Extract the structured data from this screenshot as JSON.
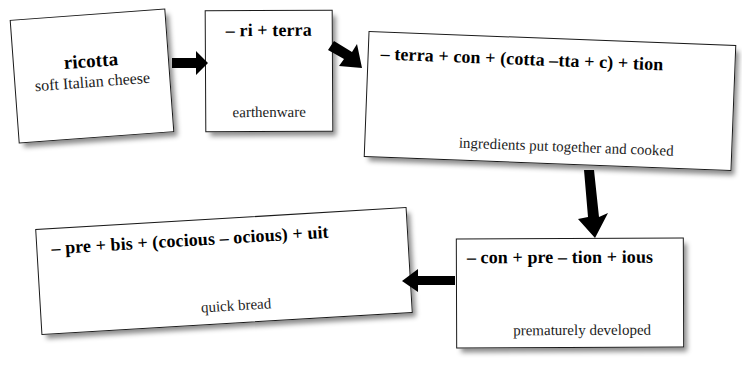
{
  "diagram": {
    "background_color": "#ffffff",
    "ink_color": "#000000",
    "nodes": [
      {
        "id": "ricotta",
        "head": "ricotta",
        "gloss": "soft Italian cheese"
      },
      {
        "id": "riterra",
        "head": "– ri + terra",
        "gloss": "earthenware"
      },
      {
        "id": "terracon",
        "head": "– terra + con + (cotta –tta + c) + tion",
        "gloss": "ingredients put together and cooked"
      },
      {
        "id": "prebis",
        "head": "– pre + bis + (cocious – ocious) + uit",
        "gloss": "quick bread"
      },
      {
        "id": "conpre",
        "head": "– con + pre – tion + ious",
        "gloss": "prematurely developed"
      }
    ],
    "arrows": [
      {
        "id": "ricotta-to-riterra",
        "direction": "right"
      },
      {
        "id": "riterra-to-terracon",
        "direction": "right-down"
      },
      {
        "id": "terracon-to-conpre",
        "direction": "down"
      },
      {
        "id": "conpre-to-prebis",
        "direction": "left"
      }
    ]
  }
}
